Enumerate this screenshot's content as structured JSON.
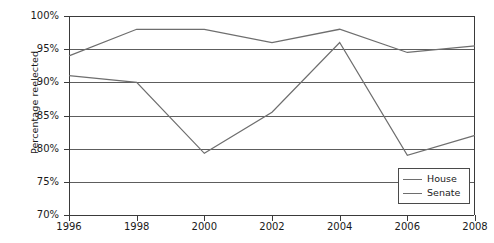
{
  "chart_data": {
    "type": "line",
    "title": "",
    "xlabel": "",
    "ylabel": "Percentage reelected",
    "x": [
      1996,
      1998,
      2000,
      2002,
      2004,
      2006,
      2008
    ],
    "xticklabels": [
      "1996",
      "1998",
      "2000",
      "2002",
      "2004",
      "2006",
      "2008"
    ],
    "xlim": [
      1996,
      2008
    ],
    "ylim": [
      70,
      100
    ],
    "yticks": [
      70,
      75,
      80,
      85,
      90,
      95,
      100
    ],
    "yticklabels": [
      "70%",
      "75%",
      "80%",
      "85%",
      "90%",
      "95%",
      "100%"
    ],
    "grid": true,
    "grid_axis": "y",
    "legend_position": "bottom-right",
    "series": [
      {
        "name": "House",
        "color": "#6e6e6e",
        "values": [
          91.0,
          90.0,
          79.3,
          85.5,
          96.0,
          79.0,
          82.0
        ]
      },
      {
        "name": "Senate",
        "color": "#6e6e6e",
        "values": [
          94.0,
          98.0,
          98.0,
          96.0,
          98.0,
          94.5,
          95.5
        ]
      }
    ]
  },
  "legend": {
    "items": [
      {
        "label": "House"
      },
      {
        "label": "Senate"
      }
    ]
  },
  "colors": {
    "line": "#6e6e6e",
    "axis": "#3a3a3a",
    "grid": "#5d5d5d",
    "background": "#ffffff",
    "text": "#1a1a1a"
  }
}
